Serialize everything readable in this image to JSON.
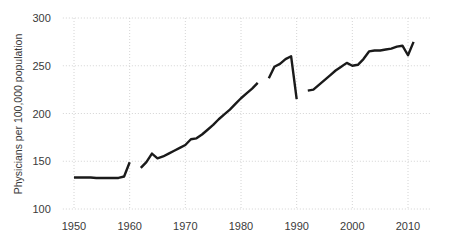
{
  "chart_data": {
    "type": "line",
    "title": "",
    "subtitle": "",
    "xlabel": "",
    "ylabel": "Physicians per 100,000 population",
    "xlim": [
      1948,
      2014
    ],
    "ylim": [
      100,
      300
    ],
    "xticks": [
      1950,
      1960,
      1970,
      1980,
      1990,
      2000,
      2010
    ],
    "xtick_labels": [
      "1950",
      "1960",
      "1970",
      "1980",
      "1990",
      "2000",
      "2010"
    ],
    "yticks": [
      100,
      150,
      200,
      250,
      300
    ],
    "ytick_labels": [
      "100",
      "150",
      "200",
      "250",
      "300"
    ],
    "grid": true,
    "legend": "none",
    "line_color": "#1a1a1a",
    "grid_color": "#c9c9c9",
    "background_color": "#ffffff",
    "series": [
      {
        "name": "Physicians per 100,000 population",
        "segments": [
          {
            "note": "1950-1960 pre-break series",
            "x": [
              1950,
              1951,
              1952,
              1953,
              1954,
              1955,
              1956,
              1957,
              1958,
              1959,
              1960
            ],
            "y": [
              133,
              133,
              133,
              133,
              132.5,
              132.5,
              132.5,
              132.5,
              132.5,
              134,
              149
            ]
          },
          {
            "note": "1962-1983 series",
            "x": [
              1962,
              1963,
              1964,
              1965,
              1966,
              1967,
              1968,
              1969,
              1970,
              1971,
              1972,
              1973,
              1974,
              1975,
              1976,
              1977,
              1978,
              1979,
              1980,
              1981,
              1982,
              1983
            ],
            "y": [
              143,
              149,
              158,
              153,
              155,
              158,
              161,
              164,
              167,
              173,
              174,
              178,
              183,
              188,
              194,
              199,
              204,
              210,
              216,
              221,
              226,
              232
            ]
          },
          {
            "note": "1985-1990 series with 1990 drop",
            "x": [
              1985,
              1986,
              1987,
              1988,
              1989,
              1990
            ],
            "y": [
              237,
              249,
              252,
              257,
              260,
              215
            ]
          },
          {
            "note": "1992-2011 series",
            "x": [
              1992,
              1993,
              1994,
              1995,
              1996,
              1997,
              1998,
              1999,
              2000,
              2001,
              2002,
              2003,
              2004,
              2005,
              2006,
              2007,
              2008,
              2009,
              2010,
              2011
            ],
            "y": [
              224,
              225,
              230,
              235,
              240,
              245,
              249,
              253,
              250,
              251,
              257,
              265,
              266,
              266,
              267,
              268,
              270,
              271,
              261,
              275
            ]
          }
        ]
      }
    ]
  },
  "axes": {
    "y_axis_title": "Physicians per 100,000 population"
  }
}
